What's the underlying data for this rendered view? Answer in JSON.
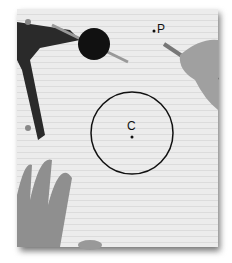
{
  "scene": {
    "description": "Grayscale photo of lined paper with a drawing compass, a circle with center C, a point P, and hands holding a pencil",
    "labels": {
      "center": "C",
      "point": "P"
    },
    "colors": {
      "paper": "#ececec",
      "ink": "#111111",
      "skin": "#9a9a9a",
      "compass": "#2a2a2a"
    }
  }
}
